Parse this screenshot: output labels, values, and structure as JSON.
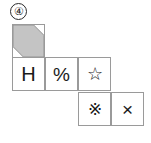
{
  "figure": {
    "item_number": "④",
    "item_number_name": "circled-four",
    "cell_size_px": 33,
    "colors": {
      "grid_line": "#9a9a9a",
      "glyph": "#1a1a1a",
      "shade_fill": "#c4c4c4",
      "shade_edge": "#8f8f8f",
      "background": "#ffffff"
    }
  },
  "grid": {
    "rows": 3,
    "cols": 4,
    "cells": [
      {
        "id": "cell-r0c0",
        "row": 0,
        "col": 0,
        "x": 12,
        "y": 24,
        "type": "shaded",
        "glyph": "",
        "glyph_name": "diagonal-band-shading",
        "label": "shaded band face"
      },
      {
        "id": "cell-r1c0",
        "row": 1,
        "col": 0,
        "x": 12,
        "y": 57,
        "type": "glyph",
        "glyph": "H",
        "glyph_name": "letter-h",
        "label": "H face"
      },
      {
        "id": "cell-r1c1",
        "row": 1,
        "col": 1,
        "x": 45,
        "y": 57,
        "type": "glyph",
        "glyph": "%",
        "glyph_name": "percent-sign",
        "label": "percent face"
      },
      {
        "id": "cell-r1c2",
        "row": 1,
        "col": 2,
        "x": 78,
        "y": 57,
        "type": "glyph",
        "glyph": "☆",
        "glyph_name": "star-outline",
        "label": "star face"
      },
      {
        "id": "cell-r2c2",
        "row": 2,
        "col": 2,
        "x": 78,
        "y": 92,
        "type": "glyph",
        "glyph": "※",
        "glyph_name": "reference-mark",
        "label": "reference mark face"
      },
      {
        "id": "cell-r2c3",
        "row": 2,
        "col": 3,
        "x": 111,
        "y": 92,
        "type": "glyph",
        "glyph": "×",
        "glyph_name": "multiplication-sign",
        "label": "times face"
      }
    ]
  }
}
